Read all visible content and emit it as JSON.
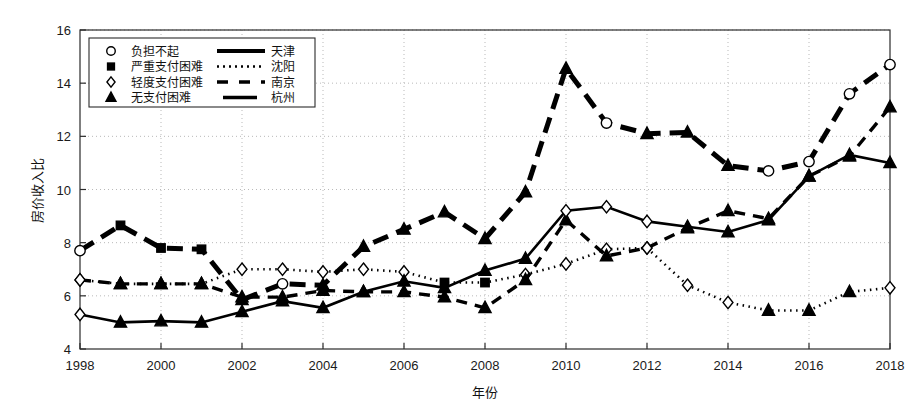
{
  "figure": {
    "background": "#ffffff",
    "ink_color": "#000000",
    "grid_color": "#b9b9b9"
  },
  "chart_data": {
    "type": "line",
    "title": "",
    "xlabel": "年份",
    "ylabel": "房价收入比",
    "xlim": [
      1998,
      2018
    ],
    "ylim": [
      4,
      16
    ],
    "yticks": [
      4,
      6,
      8,
      10,
      12,
      14,
      16
    ],
    "ytick_labels": [
      "4",
      "6",
      "8",
      "10",
      "12",
      "14",
      "16"
    ],
    "xticks": [
      1998,
      2000,
      2002,
      2004,
      2006,
      2008,
      2010,
      2012,
      2014,
      2016,
      2018
    ],
    "xtick_labels": [
      "1998",
      "2000",
      "2002",
      "2004",
      "2006",
      "2008",
      "2010",
      "2012",
      "2014",
      "2016",
      "2018"
    ],
    "grid": true,
    "grid_style": "dotted",
    "legend_position": "upper-left",
    "x": [
      1998,
      1999,
      2000,
      2001,
      2002,
      2003,
      2004,
      2005,
      2006,
      2007,
      2008,
      2009,
      2010,
      2011,
      2012,
      2013,
      2014,
      2015,
      2016,
      2017,
      2018
    ],
    "series": [
      {
        "name": "天津",
        "city": "天津",
        "line_style": "thick-dashed",
        "stroke_width": 5.0,
        "dash": "16 9",
        "values": [
          7.7,
          8.65,
          7.8,
          7.75,
          5.85,
          6.45,
          6.4,
          7.85,
          8.5,
          9.15,
          8.15,
          9.9,
          14.55,
          12.5,
          12.1,
          12.15,
          10.9,
          10.7,
          11.05,
          13.6,
          14.7
        ],
        "marker_by_point": [
          "circle",
          "square",
          "square",
          "square",
          "triangle",
          "circle",
          "triangle",
          "triangle",
          "triangle",
          "triangle",
          "triangle",
          "triangle",
          "triangle",
          "circle",
          "triangle",
          "triangle",
          "triangle",
          "circle",
          "circle",
          "circle",
          "circle"
        ]
      },
      {
        "name": "沈阳",
        "city": "沈阳",
        "line_style": "dotted",
        "stroke_width": 2.6,
        "dash": "1.5 4.5",
        "values": [
          6.6,
          6.45,
          6.45,
          6.45,
          7.0,
          7.0,
          6.9,
          7.0,
          6.9,
          6.5,
          6.5,
          6.8,
          7.2,
          7.75,
          7.8,
          6.4,
          5.75,
          5.45,
          5.45,
          6.15,
          6.3
        ],
        "marker_by_point": [
          "diamond",
          "triangle",
          "triangle",
          "triangle",
          "diamond",
          "diamond",
          "diamond",
          "diamond",
          "diamond",
          "square",
          "square",
          "diamond",
          "diamond",
          "diamond",
          "diamond",
          "diamond",
          "diamond",
          "triangle",
          "triangle",
          "triangle",
          "diamond"
        ]
      },
      {
        "name": "南京",
        "city": "南京",
        "line_style": "dashed",
        "stroke_width": 3.4,
        "dash": "11 8",
        "values": [
          6.6,
          6.45,
          6.45,
          6.45,
          5.95,
          5.95,
          6.2,
          6.15,
          6.15,
          5.95,
          5.55,
          6.6,
          8.85,
          7.5,
          7.8,
          8.55,
          9.2,
          8.9,
          10.5,
          11.25,
          13.1
        ],
        "marker_by_point": [
          "diamond",
          "triangle",
          "triangle",
          "triangle",
          "triangle",
          "triangle",
          "triangle",
          "triangle",
          "triangle",
          "triangle",
          "triangle",
          "triangle",
          "triangle",
          "triangle",
          "diamond",
          "triangle",
          "triangle",
          "triangle",
          "triangle",
          "triangle",
          "triangle"
        ]
      },
      {
        "name": "杭州",
        "city": "杭州",
        "line_style": "solid",
        "stroke_width": 2.6,
        "dash": "",
        "values": [
          5.3,
          5.0,
          5.05,
          5.0,
          5.4,
          5.8,
          5.55,
          6.15,
          6.55,
          6.3,
          6.95,
          7.4,
          9.2,
          9.35,
          8.8,
          8.6,
          8.4,
          8.85,
          10.5,
          11.3,
          11.0
        ],
        "marker_by_point": [
          "diamond",
          "triangle",
          "triangle",
          "triangle",
          "triangle",
          "triangle",
          "triangle",
          "triangle",
          "triangle",
          "triangle",
          "triangle",
          "triangle",
          "diamond",
          "diamond",
          "diamond",
          "triangle",
          "triangle",
          "triangle",
          "triangle",
          "triangle",
          "triangle"
        ]
      }
    ]
  },
  "legend": {
    "entries": [
      {
        "marker": "circle",
        "marker_label": "负担不起",
        "line_style": "thick-dashed",
        "city": "天津"
      },
      {
        "marker": "square",
        "marker_label": "严重支付困难",
        "line_style": "dotted",
        "city": "沈阳"
      },
      {
        "marker": "diamond",
        "marker_label": "轻度支付困难",
        "line_style": "dashed",
        "city": "南京"
      },
      {
        "marker": "triangle",
        "marker_label": "无支付困难",
        "line_style": "solid",
        "city": "杭州"
      }
    ]
  }
}
